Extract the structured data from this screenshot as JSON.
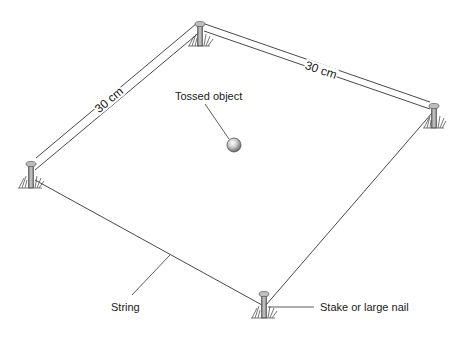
{
  "diagram": {
    "title": "",
    "labels": {
      "side_left": "30 cm",
      "side_right": "30 cm",
      "tossed_object": "Tossed object",
      "string": "String",
      "stake": "Stake or large nail"
    },
    "elements": {
      "stakes": [
        "top",
        "left",
        "right",
        "bottom"
      ],
      "object": "ball",
      "shape": "square outlined by string between four stakes"
    },
    "colors": {
      "line": "#333333",
      "background": "#ffffff",
      "stake": "#8a8a8a",
      "grass": "#555555"
    }
  }
}
